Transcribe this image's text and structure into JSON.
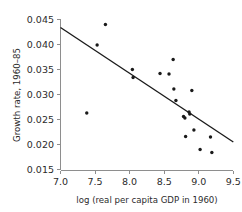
{
  "chart_data": {
    "type": "scatter",
    "title": "",
    "xlabel": "log (real per capita GDP in 1960)",
    "ylabel": "Growth rate, 1960–85",
    "xlim": [
      7.0,
      9.5
    ],
    "ylim": [
      0.015,
      0.045
    ],
    "xticks": [
      7.0,
      7.5,
      8.0,
      8.5,
      9.0,
      9.5
    ],
    "xtick_labels": [
      "7.0",
      "7.5",
      "8.0",
      "8.5",
      "9.0",
      "9.5"
    ],
    "yticks": [
      0.015,
      0.02,
      0.025,
      0.03,
      0.035,
      0.04,
      0.045
    ],
    "ytick_labels": [
      "0.015",
      "0.020",
      "0.025",
      "0.030",
      "0.035",
      "0.040",
      "0.045"
    ],
    "grid": false,
    "legend": null,
    "marker": "filled-circle",
    "marker_color": "#1a1a1a",
    "points": [
      {
        "x": 7.38,
        "y": 0.0263
      },
      {
        "x": 7.53,
        "y": 0.0399
      },
      {
        "x": 7.65,
        "y": 0.044
      },
      {
        "x": 8.04,
        "y": 0.035
      },
      {
        "x": 8.05,
        "y": 0.0334
      },
      {
        "x": 8.44,
        "y": 0.0342
      },
      {
        "x": 8.57,
        "y": 0.0341
      },
      {
        "x": 8.63,
        "y": 0.037
      },
      {
        "x": 8.64,
        "y": 0.0311
      },
      {
        "x": 8.67,
        "y": 0.0288
      },
      {
        "x": 8.78,
        "y": 0.0256
      },
      {
        "x": 8.8,
        "y": 0.0253
      },
      {
        "x": 8.81,
        "y": 0.0216
      },
      {
        "x": 8.86,
        "y": 0.0265
      },
      {
        "x": 8.87,
        "y": 0.0261
      },
      {
        "x": 8.9,
        "y": 0.0308
      },
      {
        "x": 8.93,
        "y": 0.0229
      },
      {
        "x": 9.02,
        "y": 0.019
      },
      {
        "x": 9.17,
        "y": 0.0215
      },
      {
        "x": 9.19,
        "y": 0.0184
      }
    ],
    "trendline": {
      "type": "linear-fit",
      "x_start": 7.0,
      "y_start": 0.0434,
      "x_end": 9.5,
      "y_end": 0.0205
    }
  }
}
